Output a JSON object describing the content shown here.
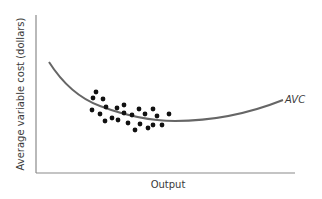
{
  "chart_data": {
    "type": "scatter",
    "title": "",
    "xlabel": "Output",
    "ylabel": "Average variable cost (dollars)",
    "grid": false,
    "legend": null,
    "annotations": [
      {
        "text": "AVC",
        "target": "fitted curve",
        "position": "right end of curve"
      }
    ],
    "series": [
      {
        "name": "Observations",
        "kind": "scatter",
        "marker": "filled-circle",
        "color": "#111111",
        "points_px": [
          [
            96,
            92
          ],
          [
            93,
            98
          ],
          [
            103,
            99
          ],
          [
            106,
            107
          ],
          [
            92,
            110
          ],
          [
            100,
            114
          ],
          [
            105,
            121
          ],
          [
            112,
            118
          ],
          [
            117,
            108
          ],
          [
            118,
            120
          ],
          [
            124,
            105
          ],
          [
            124,
            113
          ],
          [
            128,
            123
          ],
          [
            132,
            115
          ],
          [
            135,
            130
          ],
          [
            139,
            109
          ],
          [
            140,
            124
          ],
          [
            145,
            114
          ],
          [
            148,
            128
          ],
          [
            153,
            109
          ],
          [
            153,
            125
          ],
          [
            157,
            116
          ],
          [
            162,
            125
          ],
          [
            169,
            114
          ]
        ]
      },
      {
        "name": "AVC",
        "kind": "line",
        "shape": "U-shaped fitted curve",
        "color": "#666666",
        "path_px": "M49,62 Q70,95 100,106 Q140,121 175,121 Q230,121 283,100"
      }
    ],
    "axes_px": {
      "origin": [
        36,
        173
      ],
      "x_end": 295,
      "y_top": 15
    },
    "ticks": {
      "x": [],
      "y": []
    }
  },
  "labels": {
    "x_axis": "Output",
    "y_axis": "Average variable cost (dollars)",
    "curve": "AVC"
  },
  "colors": {
    "axis": "#8a8a8a",
    "curve": "#6b6b6b",
    "dots": "#111111",
    "text": "#3a3a3a"
  }
}
